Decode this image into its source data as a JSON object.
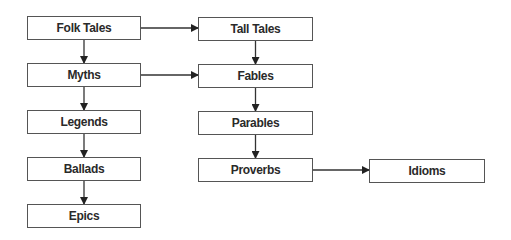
{
  "diagram": {
    "nodes": [
      {
        "id": "folk-tales",
        "label": "Folk Tales",
        "x": 27,
        "y": 16,
        "w": 114,
        "h": 24
      },
      {
        "id": "myths",
        "label": "Myths",
        "x": 27,
        "y": 63,
        "w": 114,
        "h": 24
      },
      {
        "id": "legends",
        "label": "Legends",
        "x": 27,
        "y": 110,
        "w": 114,
        "h": 24
      },
      {
        "id": "ballads",
        "label": "Ballads",
        "x": 27,
        "y": 157,
        "w": 114,
        "h": 24
      },
      {
        "id": "epics",
        "label": "Epics",
        "x": 27,
        "y": 204,
        "w": 114,
        "h": 24
      },
      {
        "id": "tall-tales",
        "label": "Tall Tales",
        "x": 198,
        "y": 17,
        "w": 115,
        "h": 24
      },
      {
        "id": "fables",
        "label": "Fables",
        "x": 198,
        "y": 64,
        "w": 115,
        "h": 24
      },
      {
        "id": "parables",
        "label": "Parables",
        "x": 198,
        "y": 111,
        "w": 115,
        "h": 24
      },
      {
        "id": "proverbs",
        "label": "Proverbs",
        "x": 198,
        "y": 158,
        "w": 115,
        "h": 24
      },
      {
        "id": "idioms",
        "label": "Idioms",
        "x": 369,
        "y": 159,
        "w": 116,
        "h": 24
      }
    ],
    "edges": [
      {
        "from": "folk-tales",
        "to": "tall-tales",
        "dir": "right"
      },
      {
        "from": "myths",
        "to": "fables",
        "dir": "right"
      },
      {
        "from": "proverbs",
        "to": "idioms",
        "dir": "right"
      },
      {
        "from": "folk-tales",
        "to": "myths",
        "dir": "down"
      },
      {
        "from": "myths",
        "to": "legends",
        "dir": "down"
      },
      {
        "from": "legends",
        "to": "ballads",
        "dir": "down"
      },
      {
        "from": "ballads",
        "to": "epics",
        "dir": "down"
      },
      {
        "from": "tall-tales",
        "to": "fables",
        "dir": "down"
      },
      {
        "from": "fables",
        "to": "parables",
        "dir": "down"
      },
      {
        "from": "parables",
        "to": "proverbs",
        "dir": "down"
      }
    ],
    "colors": {
      "border": "#555555",
      "text": "#2a2a2a",
      "edge": "#333333",
      "background": "#ffffff"
    }
  }
}
